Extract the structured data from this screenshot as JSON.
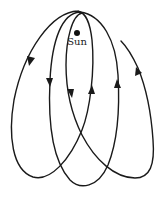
{
  "figure": {
    "type": "precessing-orbit-rosette",
    "sun": {
      "label": "Sun"
    },
    "colors": {
      "line": "#1a1a1a",
      "background": "#ffffff"
    },
    "arrows": [
      {
        "id": "outer-left-down",
        "direction": "down"
      },
      {
        "id": "mid-left-down",
        "direction": "down"
      },
      {
        "id": "inner-left-down",
        "direction": "down"
      },
      {
        "id": "inner-right-up",
        "direction": "up"
      },
      {
        "id": "mid-right-up",
        "direction": "up"
      },
      {
        "id": "outer-right-up",
        "direction": "up"
      }
    ]
  }
}
